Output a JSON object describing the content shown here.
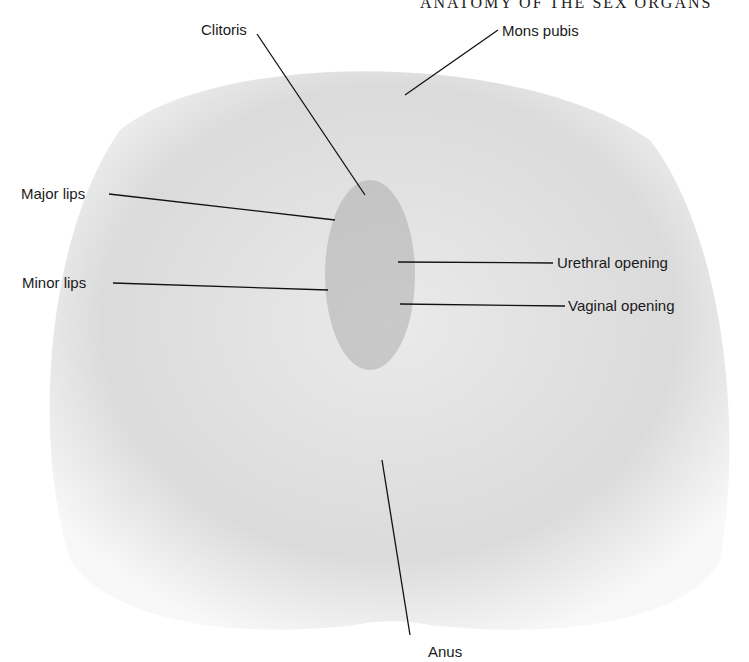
{
  "running_head": "ANATOMY OF THE SEX ORGANS",
  "figure": {
    "type": "anatomical illustration (rendered as neutral placeholder)",
    "labels": [
      {
        "id": "clitoris",
        "text": "Clitoris"
      },
      {
        "id": "mons-pubis",
        "text": "Mons pubis"
      },
      {
        "id": "major-lips",
        "text": "Major lips"
      },
      {
        "id": "minor-lips",
        "text": "Minor lips"
      },
      {
        "id": "urethral-opening",
        "text": "Urethral opening"
      },
      {
        "id": "vaginal-opening",
        "text": "Vaginal opening"
      },
      {
        "id": "anus",
        "text": "Anus"
      }
    ]
  }
}
